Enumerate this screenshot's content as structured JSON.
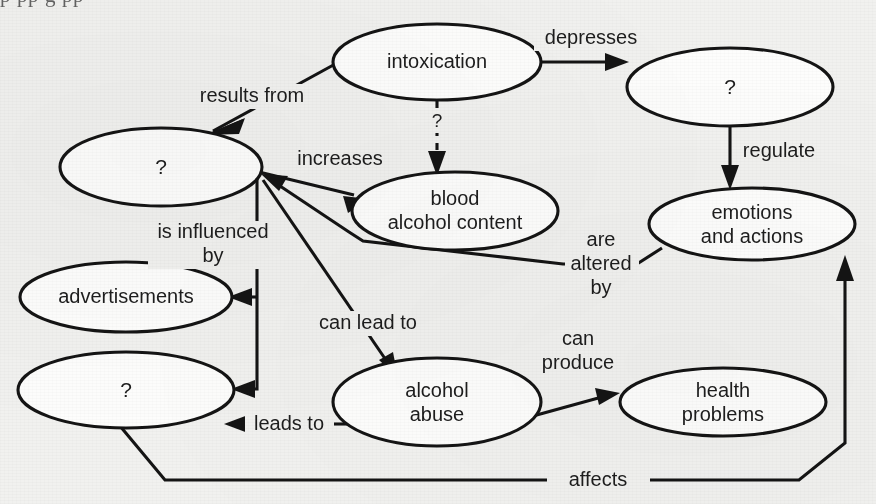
{
  "figure": {
    "type": "concept-map",
    "background_color": "#f1f1ef",
    "ink_color": "#141414",
    "node_fill": "#fdfdfc",
    "clipped_text_above": "p    pp     g   pp"
  },
  "nodes": [
    {
      "id": "intoxication",
      "label": "intoxication",
      "cx": 437,
      "cy": 62,
      "rx": 104,
      "ry": 38
    },
    {
      "id": "unknown_left",
      "label": "?",
      "cx": 161,
      "cy": 167,
      "rx": 101,
      "ry": 39
    },
    {
      "id": "unknown_top_right",
      "label": "?",
      "cx": 730,
      "cy": 87,
      "rx": 103,
      "ry": 39
    },
    {
      "id": "blood_alcohol",
      "label": "blood\nalcohol content",
      "cx": 455,
      "cy": 211,
      "rx": 103,
      "ry": 39
    },
    {
      "id": "emotions",
      "label": "emotions\nand actions",
      "cx": 752,
      "cy": 224,
      "rx": 103,
      "ry": 36
    },
    {
      "id": "advertisements",
      "label": "advertisements",
      "cx": 126,
      "cy": 297,
      "rx": 106,
      "ry": 35
    },
    {
      "id": "unknown_bottom_left",
      "label": "?",
      "cx": 126,
      "cy": 390,
      "rx": 108,
      "ry": 38
    },
    {
      "id": "alcohol_abuse",
      "label": "alcohol\nabuse",
      "cx": 437,
      "cy": 402,
      "rx": 104,
      "ry": 44
    },
    {
      "id": "health_problems",
      "label": "health\nproblems",
      "cx": 723,
      "cy": 402,
      "rx": 103,
      "ry": 34
    }
  ],
  "links": [
    {
      "id": "intoxication-results-from-unknown-left",
      "label": "results from",
      "from": "intoxication",
      "to": "unknown_left",
      "label_x": 252,
      "label_y": 96,
      "dashed": false
    },
    {
      "id": "intoxication-depresses-unknown-right",
      "label": "depresses",
      "from": "intoxication",
      "to": "unknown_top_right",
      "label_x": 591,
      "label_y": 38,
      "dashed": false
    },
    {
      "id": "intoxication-q-blood-alcohol",
      "label": "?",
      "from": "intoxication",
      "to": "blood_alcohol",
      "label_x": 437,
      "label_y": 121,
      "dashed": true
    },
    {
      "id": "unknown-left-increases-blood-alcohol",
      "label": "increases",
      "from": "unknown_left",
      "to": "blood_alcohol",
      "label_x": 340,
      "label_y": 159,
      "dashed": false
    },
    {
      "id": "unknown-right-regulate-emotions",
      "label": "regulate",
      "from": "unknown_top_right",
      "to": "emotions",
      "label_x": 776,
      "label_y": 151,
      "dashed": false
    },
    {
      "id": "emotions-are-altered-by-unknown-left",
      "label": "are\naltered\nby",
      "from": "emotions",
      "to": "unknown_left",
      "label_x": 601,
      "label_y": 258,
      "dashed": false
    },
    {
      "id": "unknown-left-is-influenced-by-ads",
      "label": "is influenced\nby",
      "from": "unknown_left",
      "to": "advertisements",
      "label_x": 212,
      "label_y": 243,
      "dashed": false
    },
    {
      "id": "unknown-left-is-influenced-by-unknown-bottom",
      "label": "",
      "from": "unknown_left",
      "to": "unknown_bottom_left",
      "label_x": 0,
      "label_y": 0,
      "dashed": false
    },
    {
      "id": "unknown-left-can-lead-to-alcohol-abuse",
      "label": "can lead to",
      "from": "unknown_left",
      "to": "alcohol_abuse",
      "label_x": 368,
      "label_y": 323,
      "dashed": false
    },
    {
      "id": "alcohol-abuse-leads-to-unknown-bottom",
      "label": "leads to",
      "from": "alcohol_abuse",
      "to": "unknown_bottom_left",
      "label_x": 288,
      "label_y": 424,
      "dashed": false
    },
    {
      "id": "alcohol-abuse-can-produce-health",
      "label": "can\nproduce",
      "from": "alcohol_abuse",
      "to": "health_problems",
      "label_x": 577,
      "label_y": 352,
      "dashed": false
    },
    {
      "id": "unknown-bottom-affects-emotions",
      "label": "affects",
      "from": "unknown_bottom_left",
      "to": "emotions",
      "label_x": 598,
      "label_y": 480,
      "dashed": false
    }
  ]
}
